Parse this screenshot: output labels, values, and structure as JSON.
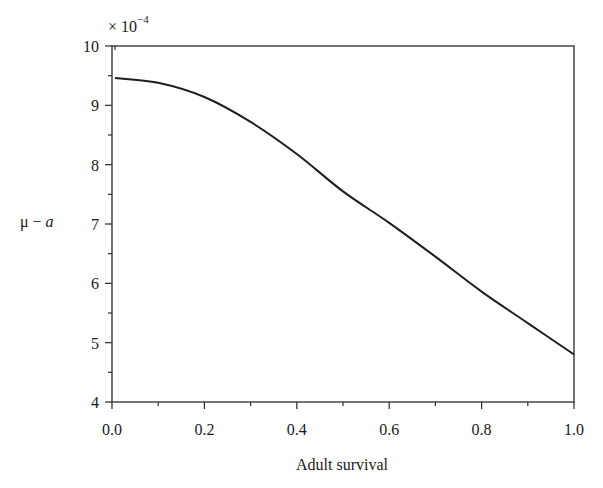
{
  "chart_data": {
    "type": "line",
    "title": "",
    "xlabel": "Adult survival",
    "ylabel": "μ − a",
    "ylabel_parts": {
      "mu": "μ",
      "minus": " − ",
      "a": "a"
    },
    "y_multiplier": "× 10",
    "y_multiplier_exponent": "−4",
    "xlim": [
      0.0,
      1.0
    ],
    "ylim": [
      4,
      10
    ],
    "xticks": [
      "0.0",
      "0.2",
      "0.4",
      "0.6",
      "0.8",
      "1.0"
    ],
    "yticks": [
      "4",
      "5",
      "6",
      "7",
      "8",
      "9",
      "10"
    ],
    "x_minor_step": 0.1,
    "y_minor_step": 0.5,
    "grid": false,
    "legend": null,
    "series": [
      {
        "name": "μ − a",
        "x": [
          0.0,
          0.1,
          0.2,
          0.3,
          0.4,
          0.5,
          0.6,
          0.7,
          0.8,
          0.9,
          1.0
        ],
        "values": [
          9.46,
          9.38,
          9.14,
          8.72,
          8.18,
          7.55,
          7.02,
          6.45,
          5.86,
          5.33,
          4.8
        ]
      }
    ]
  }
}
